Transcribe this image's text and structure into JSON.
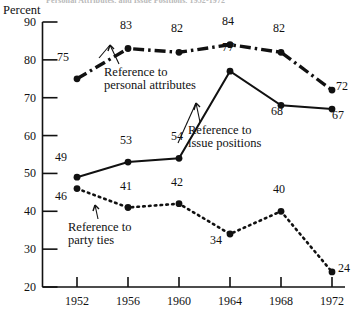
{
  "chart_data": {
    "type": "line",
    "title": "Personal Attributes, and Issue Positions, 1952-1972",
    "ylabel": "Percent",
    "xlabel": "",
    "categories": [
      "1952",
      "1956",
      "1960",
      "1964",
      "1968",
      "1972"
    ],
    "ylim": [
      20,
      90
    ],
    "yticks": [
      "20",
      "30",
      "40",
      "50",
      "60",
      "70",
      "80",
      "90"
    ],
    "grid": false,
    "legend_position": "inline-annotations",
    "series": [
      {
        "name": "Reference to personal attributes",
        "style": "dash-dot",
        "values": [
          75,
          83,
          82,
          84,
          82,
          72
        ]
      },
      {
        "name": "Reference to issue positions",
        "style": "solid",
        "values": [
          49,
          53,
          54,
          77,
          68,
          67
        ]
      },
      {
        "name": "Reference to party ties",
        "style": "dotted",
        "values": [
          46,
          41,
          42,
          34,
          40,
          24
        ]
      }
    ],
    "annotations": [
      {
        "text_line1": "Reference to",
        "text_line2": "personal attributes"
      },
      {
        "text_line1": "Reference to",
        "text_line2": "issue positions"
      },
      {
        "text_line1": "Reference to",
        "text_line2": "party ties"
      }
    ]
  },
  "labels": {
    "personal_l1": "Reference to",
    "personal_l2": "personal attributes",
    "issue_l1": "Reference to",
    "issue_l2": "issue positions",
    "party_l1": "Reference to",
    "party_l2": "party ties"
  }
}
